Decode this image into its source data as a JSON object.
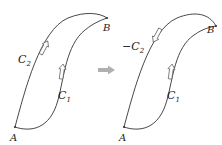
{
  "diagram": {
    "left_panel": {
      "start_point": "A",
      "end_point": "B",
      "curve_lower": "C",
      "curve_lower_sub": "1",
      "curve_upper": "C",
      "curve_upper_sub": "2",
      "curve_upper_prefix": "",
      "arrow_upper_direction": "up-toward-B",
      "arrow_lower_direction": "up-toward-B"
    },
    "transition_arrow": "right-arrow",
    "right_panel": {
      "start_point": "A",
      "end_point": "B",
      "curve_lower": "C",
      "curve_lower_sub": "1",
      "curve_upper": "C",
      "curve_upper_sub": "2",
      "curve_upper_prefix": "−",
      "arrow_upper_direction": "down-toward-A",
      "arrow_lower_direction": "up-toward-B"
    },
    "colors": {
      "line": "#333333",
      "arrow_outline": "#555555",
      "transition_arrow": "#b0b0b0"
    }
  }
}
